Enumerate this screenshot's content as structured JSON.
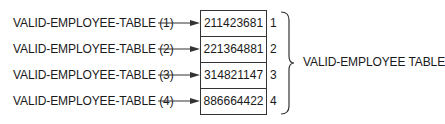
{
  "diagram": {
    "references": [
      {
        "label": "VALID-EMPLOYEE-TABLE (1)"
      },
      {
        "label": "VALID-EMPLOYEE-TABLE (2)"
      },
      {
        "label": "VALID-EMPLOYEE-TABLE (3)"
      },
      {
        "label": "VALID-EMPLOYEE-TABLE (4)"
      }
    ],
    "table": {
      "name": "VALID-EMPLOYEE TABLE",
      "rows": [
        {
          "value": "211423681",
          "index": "1"
        },
        {
          "value": "221364881",
          "index": "2"
        },
        {
          "value": "314821147",
          "index": "3"
        },
        {
          "value": "886664422",
          "index": "4"
        }
      ]
    },
    "colors": {
      "line": "#333333",
      "text": "#1a1a1a",
      "background": "#ffffff"
    }
  }
}
